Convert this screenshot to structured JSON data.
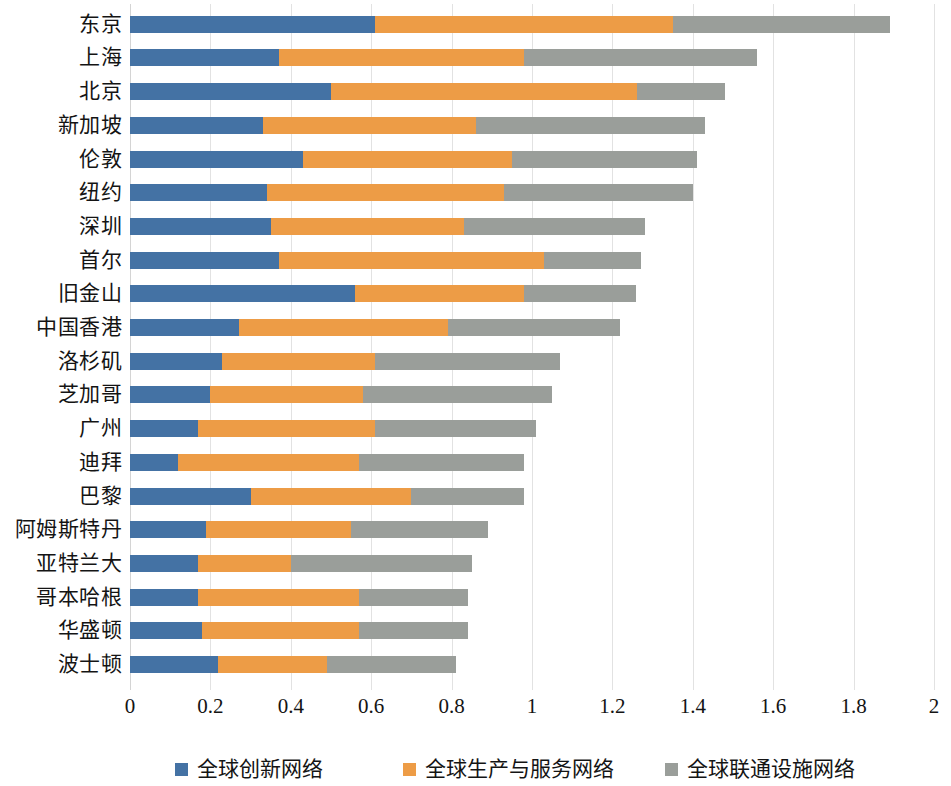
{
  "chart_data": {
    "type": "bar",
    "orientation": "horizontal",
    "stacked": true,
    "title": "",
    "xlabel": "",
    "ylabel": "",
    "xlim": [
      0,
      2
    ],
    "xticks": [
      "0",
      "0.2",
      "0.4",
      "0.6",
      "0.8",
      "1",
      "1.2",
      "1.4",
      "1.6",
      "1.8",
      "2"
    ],
    "xtick_values": [
      0,
      0.2,
      0.4,
      0.6,
      0.8,
      1,
      1.2,
      1.4,
      1.6,
      1.8,
      2
    ],
    "grid": true,
    "grid_axis": "x",
    "legend_position": "bottom",
    "categories": [
      "东京",
      "上海",
      "北京",
      "新加坡",
      "伦敦",
      "纽约",
      "深圳",
      "首尔",
      "旧金山",
      "中国香港",
      "洛杉矶",
      "芝加哥",
      "广州",
      "迪拜",
      "巴黎",
      "阿姆斯特丹",
      "亚特兰大",
      "哥本哈根",
      "华盛顿",
      "波士顿"
    ],
    "series": [
      {
        "name": "全球创新网络",
        "color": "#4472a4",
        "values": [
          0.61,
          0.37,
          0.5,
          0.33,
          0.43,
          0.34,
          0.35,
          0.37,
          0.56,
          0.27,
          0.23,
          0.2,
          0.17,
          0.12,
          0.3,
          0.19,
          0.17,
          0.17,
          0.18,
          0.22
        ]
      },
      {
        "name": "全球生产与服务网络",
        "color": "#ed9c46",
        "values": [
          0.74,
          0.61,
          0.76,
          0.53,
          0.52,
          0.59,
          0.48,
          0.66,
          0.42,
          0.52,
          0.38,
          0.38,
          0.44,
          0.45,
          0.4,
          0.36,
          0.23,
          0.4,
          0.39,
          0.27
        ]
      },
      {
        "name": "全球联通设施网络",
        "color": "#9a9e9a",
        "values": [
          0.54,
          0.58,
          0.22,
          0.57,
          0.46,
          0.47,
          0.45,
          0.24,
          0.28,
          0.43,
          0.46,
          0.47,
          0.4,
          0.41,
          0.28,
          0.34,
          0.45,
          0.27,
          0.27,
          0.32
        ]
      }
    ],
    "totals": [
      1.89,
      1.56,
      1.48,
      1.43,
      1.41,
      1.4,
      1.28,
      1.27,
      1.26,
      1.22,
      1.07,
      1.05,
      1.01,
      0.98,
      0.98,
      0.89,
      0.85,
      0.84,
      0.84,
      0.81
    ]
  },
  "legend": {
    "items": [
      {
        "label": "全球创新网络",
        "color": "#4472a4"
      },
      {
        "label": "全球生产与服务网络",
        "color": "#ed9c46"
      },
      {
        "label": "全球联通设施网络",
        "color": "#9a9e9a"
      }
    ]
  }
}
